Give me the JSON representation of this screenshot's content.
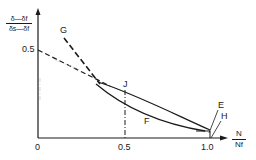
{
  "diagram": {
    "y_axis": {
      "label_numerator": "δ—δf",
      "label_denominator": "δs—δf",
      "ticks": [
        {
          "label": "0.5"
        }
      ]
    },
    "x_axis": {
      "label_numerator": "N",
      "label_denominator": "Nf",
      "ticks": [
        {
          "label": "0"
        },
        {
          "label": "0.5"
        },
        {
          "label": "1.0"
        }
      ]
    },
    "curves": [
      {
        "id": "E",
        "label": "E",
        "style": "solid",
        "description": "upper solid curve ending at N/Nf = 1.0"
      },
      {
        "id": "F",
        "label": "F",
        "style": "solid",
        "description": "lower solid curve"
      },
      {
        "id": "G",
        "label": "G",
        "style": "dashed",
        "description": "steep dashed line from upper left"
      },
      {
        "id": "H",
        "label": "H",
        "style": "solid",
        "description": "curve end near N/Nf = 1.0"
      },
      {
        "id": "J",
        "label": "J",
        "style": "dash-dot",
        "description": "marker at N/Nf = 0.5"
      }
    ],
    "line_color": "#1a1a1a",
    "background": "#ffffff"
  }
}
